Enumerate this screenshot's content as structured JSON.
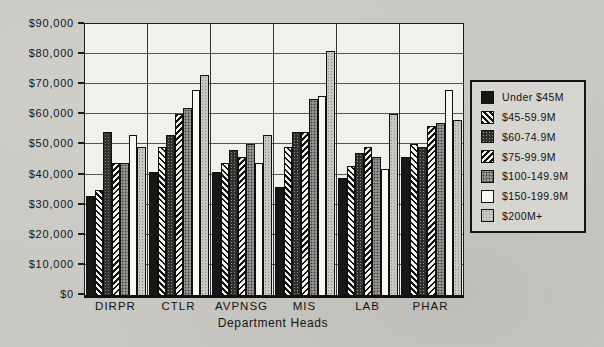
{
  "chart_data": {
    "type": "bar",
    "title": "",
    "xlabel": "Department Heads",
    "ylabel": "",
    "ylim": [
      0,
      90000
    ],
    "ytick_step": 10000,
    "ytick_labels": [
      "$0",
      "$10,000",
      "$20,000",
      "$30,000",
      "$40,000",
      "$50,000",
      "$60,000",
      "$70,000",
      "$80,000",
      "$90,000"
    ],
    "grid": true,
    "legend_position": "right",
    "categories": [
      "DIRPR",
      "CTLR",
      "AVPNSG",
      "MIS",
      "LAB",
      "PHAR"
    ],
    "series": [
      {
        "name": "Under $45M",
        "pattern": "solid-black",
        "values": [
          33000,
          41000,
          41000,
          36000,
          39000,
          46000
        ]
      },
      {
        "name": "$45-59.9M",
        "pattern": "hatch-backslash",
        "values": [
          35000,
          49000,
          44000,
          49000,
          43000,
          50000
        ]
      },
      {
        "name": "$60-74.9M",
        "pattern": "dots-dark",
        "values": [
          54000,
          53000,
          48000,
          54000,
          47000,
          49000
        ]
      },
      {
        "name": "$75-99.9M",
        "pattern": "hatch-slash",
        "values": [
          44000,
          60000,
          46000,
          54000,
          49000,
          56000
        ]
      },
      {
        "name": "$100-149.9M",
        "pattern": "dots-medium",
        "values": [
          44000,
          62000,
          50000,
          65000,
          46000,
          57000
        ]
      },
      {
        "name": "$150-199.9M",
        "pattern": "white",
        "values": [
          53000,
          68000,
          44000,
          66000,
          42000,
          68000
        ]
      },
      {
        "name": "$200M+",
        "pattern": "dots-light",
        "values": [
          49000,
          73000,
          53000,
          81000,
          60000,
          58000
        ]
      }
    ],
    "colors": {
      "page_background": "#c9c8c2",
      "plot_background": "#f1f0ea",
      "bar_black": "#171717",
      "axis_line": "#1c1c1c",
      "legend_background": "#d6d5cf"
    }
  }
}
